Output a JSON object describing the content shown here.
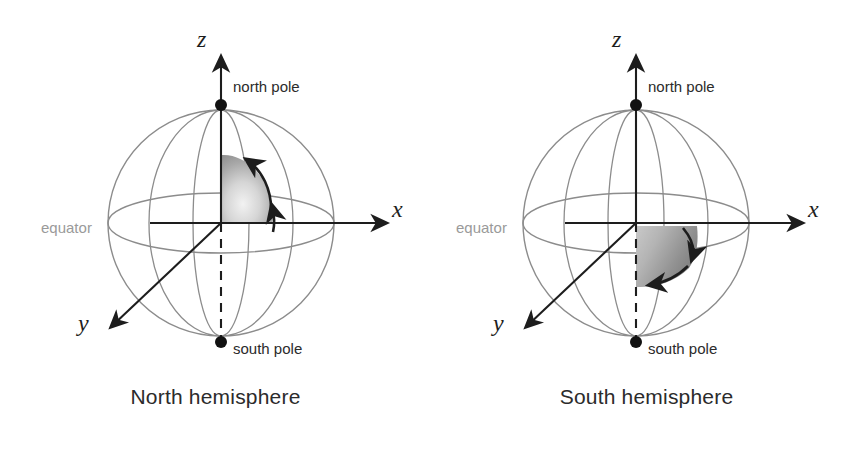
{
  "figure": {
    "background_color": "#ffffff",
    "panels": [
      {
        "id": "north",
        "caption": "North hemisphere",
        "axes": {
          "z_label": "z",
          "x_label": "x",
          "y_label": "y"
        },
        "labels": {
          "north_pole": "north pole",
          "south_pole": "south pole",
          "equator": "equator"
        },
        "sphere": {
          "center_x": 221,
          "center_y": 223,
          "radius": 113,
          "outline_color": "#8c8c8c",
          "equator_ry": 30,
          "meridian_rx_wide": 72,
          "meridian_rx_narrow": 30
        },
        "shaded_region": {
          "description": "spherical lune in the northern octant between z-axis and x-axis",
          "fill_light": "#efefef",
          "fill_dark": "#8f8f8f",
          "arrow_count": 2,
          "arrow_direction": "counterclockwise",
          "arrow_color": "#1d1d1d"
        },
        "poles": {
          "north_pole_x": 221,
          "north_pole_y": 105,
          "south_pole_x": 221,
          "south_pole_y": 342,
          "marker_color": "#111111"
        }
      },
      {
        "id": "south",
        "caption": "South hemisphere",
        "axes": {
          "z_label": "z",
          "x_label": "x",
          "y_label": "y"
        },
        "labels": {
          "north_pole": "north pole",
          "south_pole": "south pole",
          "equator": "equator"
        },
        "sphere": {
          "center_x": 205,
          "center_y": 223,
          "radius": 113,
          "outline_color": "#8c8c8c",
          "equator_ry": 30,
          "meridian_rx_wide": 72,
          "meridian_rx_narrow": 30
        },
        "shaded_region": {
          "description": "region below the x-axis in the southern octant between z-axis and x-axis",
          "fill_light": "#d8d8d8",
          "fill_dark": "#7e7e7e",
          "arrow_count": 2,
          "arrow_direction": "downward-right",
          "arrow_color": "#1d1d1d"
        },
        "poles": {
          "north_pole_x": 205,
          "north_pole_y": 105,
          "south_pole_x": 205,
          "south_pole_y": 342,
          "marker_color": "#111111"
        }
      }
    ],
    "colors": {
      "text": "#2b2b2b",
      "axis": "#1d1d1d",
      "sphere_outline": "#8c8c8c",
      "equator_label": "#9a9a9a"
    }
  }
}
